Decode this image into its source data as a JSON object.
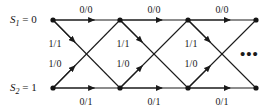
{
  "figure": {
    "type": "trellis-diagram",
    "background_color": "#ffffff",
    "line_color": "#1a1a1a",
    "node_color": "#141414"
  },
  "states": [
    {
      "id": "s1",
      "label_var": "S",
      "label_sub": "1",
      "label_eq": " = 0",
      "full": "S1 = 0",
      "row": "top",
      "y": 20
    },
    {
      "id": "s2",
      "label_var": "S",
      "label_sub": "2",
      "label_eq": " = 1",
      "full": "S2 = 1",
      "row": "bottom",
      "y": 88
    }
  ],
  "top_edge_labels": [
    {
      "text": "0/0",
      "x": 86,
      "y": 4
    },
    {
      "text": "0/0",
      "x": 154,
      "y": 4
    },
    {
      "text": "0/0",
      "x": 222,
      "y": 4
    }
  ],
  "bottom_edge_labels": [
    {
      "text": "0/1",
      "x": 86,
      "y": 96
    },
    {
      "text": "0/1",
      "x": 154,
      "y": 96
    },
    {
      "text": "0/1",
      "x": 222,
      "y": 96
    }
  ],
  "down_diagonal_labels": [
    {
      "text": "1/1",
      "x": 55,
      "y": 38
    },
    {
      "text": "1/1",
      "x": 123,
      "y": 38
    },
    {
      "text": "1/1",
      "x": 191,
      "y": 38
    }
  ],
  "up_diagonal_labels": [
    {
      "text": "1/0",
      "x": 55,
      "y": 58
    },
    {
      "text": "1/0",
      "x": 123,
      "y": 58
    },
    {
      "text": "1/0",
      "x": 191,
      "y": 58
    }
  ],
  "continuation": {
    "text": "•••",
    "x": 240,
    "y": 47
  },
  "nodes": {
    "xs": [
      53,
      120,
      188,
      256
    ],
    "top_y": 20,
    "bottom_y": 88,
    "radius": 2.6
  },
  "chart_data": {
    "type": "diagram",
    "states": [
      "S1 = 0",
      "S2 = 1"
    ],
    "stages": 4,
    "transitions": [
      {
        "from": "S1 = 0",
        "to": "S1 = 0",
        "label": "0/0"
      },
      {
        "from": "S1 = 0",
        "to": "S2 = 1",
        "label": "1/1"
      },
      {
        "from": "S2 = 1",
        "to": "S1 = 0",
        "label": "1/0"
      },
      {
        "from": "S2 = 1",
        "to": "S2 = 1",
        "label": "0/1"
      }
    ]
  }
}
